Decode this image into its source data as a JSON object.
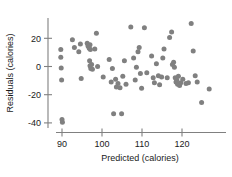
{
  "chart_data": {
    "type": "scatter",
    "title": "",
    "xlabel": "Predicted (calories)",
    "ylabel": "Residuals (calories)",
    "xlim": [
      87,
      128.5
    ],
    "ylim": [
      -45,
      33
    ],
    "xticks": [
      90,
      100,
      110,
      120
    ],
    "yticks": [
      20,
      0,
      -20,
      -40
    ],
    "xtick_labels": [
      "90",
      "100",
      "110",
      "120"
    ],
    "ytick_labels": [
      "20",
      "0",
      "-20",
      "-40"
    ],
    "grid": false,
    "legend": null,
    "marker_color": "#808080",
    "axis_color": "#808080",
    "points": [
      [
        89.7,
        12.0
      ],
      [
        89.7,
        6.5
      ],
      [
        89.8,
        -1.0
      ],
      [
        89.9,
        -9.5
      ],
      [
        90.0,
        -37.5
      ],
      [
        90.1,
        -39.5
      ],
      [
        92.6,
        19.0
      ],
      [
        93.1,
        13.5
      ],
      [
        94.2,
        10.5
      ],
      [
        94.6,
        16.0
      ],
      [
        94.8,
        -8.5
      ],
      [
        96.3,
        16.5
      ],
      [
        96.5,
        14.5
      ],
      [
        96.8,
        13.0
      ],
      [
        97.0,
        15.5
      ],
      [
        97.1,
        12.0
      ],
      [
        96.9,
        4.0
      ],
      [
        97.0,
        0.5
      ],
      [
        97.2,
        -1.5
      ],
      [
        97.4,
        1.5
      ],
      [
        97.6,
        -2.0
      ],
      [
        98.2,
        12.5
      ],
      [
        98.6,
        23.5
      ],
      [
        98.9,
        0.0
      ],
      [
        100.3,
        -7.5
      ],
      [
        101.8,
        5.0
      ],
      [
        102.3,
        -11.0
      ],
      [
        102.6,
        -1.5
      ],
      [
        102.9,
        -33.5
      ],
      [
        103.4,
        -9.0
      ],
      [
        103.6,
        -14.5
      ],
      [
        104.0,
        -12.0
      ],
      [
        104.5,
        -15.0
      ],
      [
        104.9,
        -33.5
      ],
      [
        105.2,
        -7.0
      ],
      [
        105.6,
        4.0
      ],
      [
        106.0,
        -12.5
      ],
      [
        107.2,
        28.0
      ],
      [
        107.9,
        6.0
      ],
      [
        108.3,
        -9.5
      ],
      [
        108.6,
        -0.5
      ],
      [
        109.0,
        10.5
      ],
      [
        109.3,
        13.5
      ],
      [
        109.6,
        -5.0
      ],
      [
        109.9,
        -15.5
      ],
      [
        110.6,
        27.5
      ],
      [
        111.2,
        -4.5
      ],
      [
        112.4,
        7.5
      ],
      [
        112.8,
        -8.0
      ],
      [
        113.1,
        -11.5
      ],
      [
        113.6,
        2.0
      ],
      [
        114.1,
        -6.5
      ],
      [
        114.4,
        -13.0
      ],
      [
        114.9,
        -7.5
      ],
      [
        115.2,
        6.0
      ],
      [
        115.5,
        12.5
      ],
      [
        116.3,
        -8.0
      ],
      [
        116.9,
        20.5
      ],
      [
        117.4,
        24.5
      ],
      [
        117.6,
        1.5
      ],
      [
        117.9,
        3.0
      ],
      [
        118.1,
        -0.5
      ],
      [
        118.3,
        -8.0
      ],
      [
        118.5,
        -11.0
      ],
      [
        118.7,
        -9.5
      ],
      [
        118.9,
        -12.5
      ],
      [
        119.1,
        -7.0
      ],
      [
        119.4,
        -13.5
      ],
      [
        119.7,
        -11.5
      ],
      [
        120.2,
        -9.0
      ],
      [
        121.0,
        -12.0
      ],
      [
        121.6,
        -11.5
      ],
      [
        122.3,
        30.5
      ],
      [
        122.8,
        11.0
      ],
      [
        123.3,
        -6.5
      ],
      [
        123.8,
        -11.0
      ],
      [
        124.9,
        -25.5
      ],
      [
        126.8,
        -16.0
      ]
    ]
  }
}
